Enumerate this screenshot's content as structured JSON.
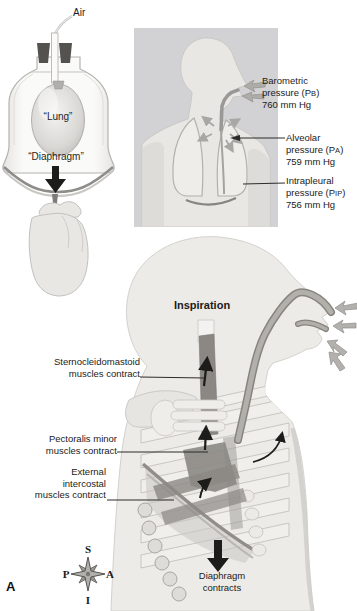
{
  "apparatus": {
    "air": "Air",
    "lung": "“Lung”",
    "diaphragm": "“Diaphragm”"
  },
  "pressures": [
    {
      "name": "Barometric",
      "line2_pre": "pressure (P",
      "sub": "B",
      "line2_post": ")",
      "value": "760 mm Hg"
    },
    {
      "name": "Alveolar",
      "line2_pre": "pressure (P",
      "sub": "A",
      "line2_post": ")",
      "value": "759 mm Hg"
    },
    {
      "name": "Intrapleural",
      "line2_pre": "pressure (P",
      "sub": "IP",
      "line2_post": ")",
      "value": "756 mm Hg"
    }
  ],
  "inspiration": {
    "title": "Inspiration",
    "muscles": [
      {
        "line1": "Sternocleidomastoid",
        "line2": "muscles contract"
      },
      {
        "line1": "Pectoralis minor",
        "line2": "muscles contract"
      },
      {
        "line1": "External",
        "line2": "intercostal",
        "line3": "muscles contract"
      }
    ],
    "diaphragm": {
      "line1": "Diaphragm",
      "line2": "contracts"
    }
  },
  "compass": {
    "top": "S",
    "bottom": "I",
    "left": "P",
    "right": "A"
  },
  "figure_letter": "A",
  "colors": {
    "panel_bg": "#d2d2d4",
    "muscle_dark": "#8b8884",
    "arrow_black": "#1c1c1a",
    "gray_arrow": "#b3b1ad"
  }
}
